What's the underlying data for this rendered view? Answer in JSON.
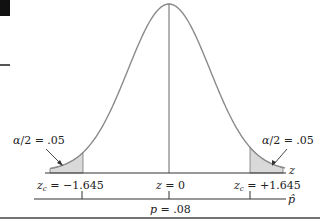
{
  "chart_data": {
    "type": "area",
    "title": "",
    "distribution": "standard normal",
    "xlabel": "z",
    "secondary_xlabel": "p̂",
    "center": {
      "z": 0,
      "label": "z = 0"
    },
    "critical_values": [
      {
        "side": "left",
        "z": -1.645,
        "label": "zc = −1.645"
      },
      {
        "side": "right",
        "z": 1.645,
        "label": "zc = +1.645"
      }
    ],
    "shaded_tails": [
      {
        "side": "left",
        "area_label": "α/2 = .05",
        "area": 0.05
      },
      {
        "side": "right",
        "area_label": "α/2 = .05",
        "area": 0.05
      }
    ],
    "p_axis_center": {
      "label": "p = .08",
      "value": 0.08
    },
    "grid": false,
    "legend": null
  },
  "labels": {
    "left_tail_prefix": "α",
    "left_tail_rest": "/2 = .05",
    "right_tail_prefix": "α",
    "right_tail_rest": "/2 = .05",
    "left_crit_z": "z",
    "left_crit_sub": "c",
    "left_crit_rest": " = −1.645",
    "right_crit_z": "z",
    "right_crit_sub": "c",
    "right_crit_rest": " = +1.645",
    "center_z": "z",
    "center_rest": " = 0",
    "p_var": "p",
    "p_rest": " = .08",
    "z_axis": "z",
    "phat_axis": "p̂"
  },
  "colors": {
    "curve": "#8a8a8a",
    "shade": "#d9d9d9",
    "axis": "#333333",
    "text": "#222222"
  }
}
